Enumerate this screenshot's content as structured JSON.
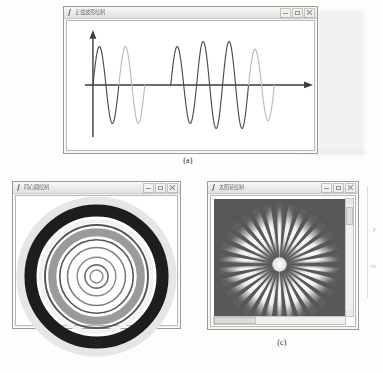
{
  "figure": {
    "captions": {
      "a": "(a)",
      "b": "(b)",
      "c": "(c)"
    },
    "margin_fragments": [
      "F",
      "nr"
    ]
  },
  "windows": {
    "a": {
      "title": "正弦波形绘制",
      "icon": "app-icon",
      "controls": {
        "minimize": "–",
        "maximize": "□",
        "close": "×"
      }
    },
    "b": {
      "title": "同心圆绘制",
      "icon": "app-icon",
      "controls": {
        "minimize": "–",
        "maximize": "□",
        "close": "×"
      }
    },
    "c": {
      "title": "太阳花绘制",
      "icon": "app-icon",
      "controls": {
        "minimize": "–",
        "maximize": "□",
        "close": "×"
      }
    }
  },
  "colors": {
    "wave_dark": "#4a4a52",
    "wave_light": "#b9b9c2",
    "axis": "#3a3a40",
    "ring_black": "#1d1d1d",
    "ring_gray": "#8e8e8e",
    "ring_halo": "#e0e0e0",
    "sun_bg": "#585858",
    "sun_ray": "#f2f2f2",
    "sun_core": "#ededed"
  },
  "chart_data": [
    {
      "id": "sine-wave",
      "type": "line",
      "title": "正弦波形绘制",
      "xlabel": "",
      "ylabel": "",
      "grid": false,
      "legend": "none",
      "axes": {
        "origin_x": 0.105,
        "origin_y": 0.5,
        "x_arrow": true,
        "y_arrow": true
      },
      "description": "Alternating dark and light sine-wave segments of varying amplitude and period drawn along a horizontal axis.",
      "segments": [
        {
          "index": 1,
          "color": "#4a4a52",
          "amplitude": 0.3,
          "period": 0.105,
          "cycles": 1,
          "x_start": 0.105
        },
        {
          "index": 2,
          "color": "#b9b9c2",
          "amplitude": 0.3,
          "period": 0.105,
          "cycles": 1,
          "x_start": 0.21
        },
        {
          "index": 3,
          "color": "#ffffff",
          "amplitude": 0.0,
          "period": 0.105,
          "cycles": 1,
          "x_start": 0.315
        },
        {
          "index": 4,
          "color": "#4a4a52",
          "amplitude": 0.3,
          "period": 0.105,
          "cycles": 1,
          "x_start": 0.42
        },
        {
          "index": 5,
          "color": "#4a4a52",
          "amplitude": 0.34,
          "period": 0.105,
          "cycles": 1,
          "x_start": 0.525
        },
        {
          "index": 6,
          "color": "#4a4a52",
          "amplitude": 0.34,
          "period": 0.105,
          "cycles": 1,
          "x_start": 0.63
        },
        {
          "index": 7,
          "color": "#b9b9c2",
          "amplitude": 0.28,
          "period": 0.105,
          "cycles": 1,
          "x_start": 0.735
        }
      ]
    },
    {
      "id": "concentric-rings",
      "type": "scatter",
      "title": "同心圆绘制",
      "description": "Concentric circles forming a target: pale halo, thick black annulus, gray band, thin inner circles and a small core circle.",
      "center": {
        "cx": 0.5,
        "cy": 0.5
      },
      "rings": [
        {
          "index": 1,
          "radius": 0.47,
          "color": "#e6e6e6",
          "stroke_width": 0.055
        },
        {
          "index": 2,
          "radius": 0.41,
          "color": "#1d1d1d",
          "stroke_width": 0.075
        },
        {
          "index": 3,
          "radius": 0.345,
          "color": "#f2f2f2",
          "stroke_width": 0.022
        },
        {
          "index": 4,
          "radius": 0.32,
          "color": "#55555a",
          "stroke_width": 0.012
        },
        {
          "index": 5,
          "radius": 0.275,
          "color": "#9a9a9a",
          "stroke_width": 0.05
        },
        {
          "index": 6,
          "radius": 0.228,
          "color": "#55555a",
          "stroke_width": 0.01
        },
        {
          "index": 7,
          "radius": 0.18,
          "color": "#7e7e7e",
          "stroke_width": 0.01
        },
        {
          "index": 8,
          "radius": 0.12,
          "color": "#8a8a8a",
          "stroke_width": 0.009
        },
        {
          "index": 9,
          "radius": 0.072,
          "color": "#6e6e6e",
          "stroke_width": 0.01
        },
        {
          "index": 10,
          "radius": 0.04,
          "color": "#8a8a8a",
          "stroke_width": 0.009
        }
      ]
    },
    {
      "id": "sunflower",
      "type": "pie",
      "title": "太阳花绘制",
      "description": "Sunflower / starburst: white tapered rays radiating from a bright core over a dark gray field, each ray fading toward its tip.",
      "background": "#585858",
      "center": {
        "cx": 0.5,
        "cy": 0.5
      },
      "ray_count": 30,
      "ray_length": 0.46,
      "ray_width_deg": 7,
      "core_radius": 0.055,
      "ray_color": "#f2f2f2",
      "core_color": "#ededed",
      "rotation_offset_deg": 6
    }
  ]
}
